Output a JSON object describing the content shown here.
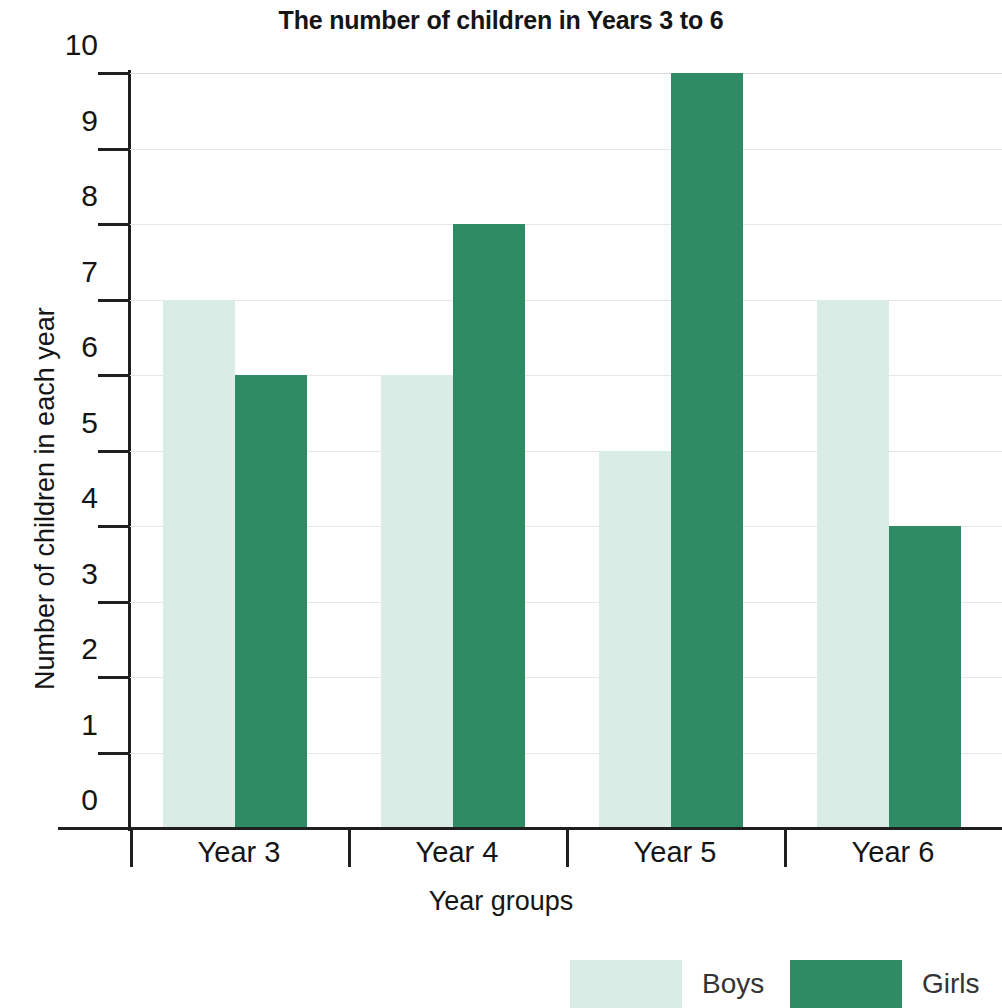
{
  "chart_data": {
    "type": "bar",
    "title": "The number of children in Years 3 to 6",
    "xlabel": "Year groups",
    "ylabel": "Number of children in each year",
    "categories": [
      "Year 3",
      "Year 4",
      "Year 5",
      "Year 6"
    ],
    "series": [
      {
        "name": "Boys",
        "color": "#d9ece6",
        "values": [
          7,
          6,
          5,
          7
        ]
      },
      {
        "name": "Girls",
        "color": "#2e8b63",
        "values": [
          6,
          8,
          10,
          4
        ]
      }
    ],
    "ylim": [
      0,
      10
    ],
    "yticks": [
      0,
      1,
      2,
      3,
      4,
      5,
      6,
      7,
      8,
      9,
      10
    ],
    "ytick_labels": [
      "0",
      "1",
      "2",
      "3",
      "4",
      "5",
      "6",
      "7",
      "8",
      "9",
      "10"
    ],
    "grid": true,
    "grid_axis": "y",
    "legend_position": "bottom-right",
    "legend": [
      "Boys",
      "Girls"
    ]
  },
  "axis": {
    "y_title": "Number of children in each year",
    "x_title": "Year groups"
  },
  "legend": {
    "items": [
      {
        "label": "Boys",
        "color": "#d9ece6"
      },
      {
        "label": "Girls",
        "color": "#2e8b63"
      }
    ]
  },
  "colors": {
    "boys": "#d9ece6",
    "girls": "#2e8b63",
    "axis": "#1f1f1f",
    "grid": "#e6e6e6",
    "text": "#151515",
    "background": "#ffffff"
  }
}
